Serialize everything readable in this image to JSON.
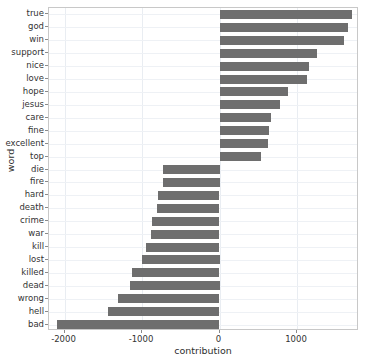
{
  "chart_data": {
    "type": "bar",
    "orientation": "horizontal",
    "title": "",
    "xlabel": "contribution",
    "ylabel": "word",
    "xlim": [
      -2200,
      1800
    ],
    "xticks": [
      -2000,
      -1000,
      0,
      1000
    ],
    "xticklabels": [
      "-2000",
      "-1000",
      "0",
      "1000"
    ],
    "grid": true,
    "legend": null,
    "bar_color": "#6e6e6e",
    "categories": [
      "true",
      "god",
      "win",
      "support",
      "nice",
      "love",
      "hope",
      "jesus",
      "care",
      "fine",
      "excellent",
      "top",
      "die",
      "fire",
      "hard",
      "death",
      "crime",
      "war",
      "kill",
      "lost",
      "killed",
      "dead",
      "wrong",
      "hell",
      "bad"
    ],
    "values": [
      1710,
      1660,
      1600,
      1260,
      1150,
      1125,
      890,
      780,
      660,
      645,
      620,
      535,
      -725,
      -725,
      -795,
      -810,
      -865,
      -890,
      -945,
      -1000,
      -1135,
      -1150,
      -1315,
      -1440,
      -2095
    ]
  },
  "axis": {
    "x_label": "contribution",
    "y_label": "word"
  }
}
